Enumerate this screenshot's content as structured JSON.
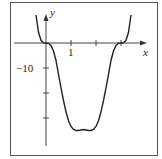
{
  "chart_data": {
    "type": "line",
    "title": "",
    "xlabel": "x",
    "ylabel": "y",
    "x_ticks": [
      1,
      2,
      3
    ],
    "x_tick_labels": [
      {
        "value": 1,
        "label": "1"
      }
    ],
    "y_ticks": [
      -10,
      -20,
      -30
    ],
    "y_tick_labels": [
      {
        "value": -10,
        "label": "−10"
      }
    ],
    "xlim": [
      -0.45,
      3.45
    ],
    "ylim": [
      -41,
      12
    ],
    "grid": false,
    "legend": null,
    "frame": true,
    "series": [
      {
        "name": "f(x)",
        "color": "#222222",
        "x": [
          -0.4,
          -0.3,
          -0.2,
          -0.1,
          0,
          0.1,
          0.2,
          0.3,
          0.4,
          0.5,
          0.6,
          0.7,
          0.8,
          0.9,
          1.0,
          1.1,
          1.2,
          1.3,
          1.4,
          1.5,
          1.6,
          1.7,
          1.8,
          1.9,
          2.0,
          2.1,
          2.2,
          2.3,
          2.4,
          2.5,
          2.6,
          2.7,
          2.8,
          2.9,
          3.0,
          3.1,
          3.2,
          3.3,
          3.4
        ],
        "y": [
          11.2,
          4.3,
          1.1,
          0.1,
          0,
          -0.1,
          -1.0,
          -3.2,
          -7.0,
          -12.5,
          -17.9,
          -23.0,
          -27.5,
          -31.1,
          -33.4,
          -34.6,
          -35.0,
          -35.0,
          -34.8,
          -34.6,
          -34.8,
          -35.0,
          -35.0,
          -34.6,
          -33.4,
          -31.1,
          -27.5,
          -23.0,
          -17.9,
          -12.5,
          -7.0,
          -3.2,
          -1.0,
          -0.1,
          0,
          0.1,
          1.1,
          4.3,
          11.2
        ]
      }
    ]
  },
  "layout": {
    "origin_px": [
      46,
      43
    ],
    "px_per_x": 25,
    "px_per_y": 2.5,
    "frame": [
      10,
      2,
      157,
      155
    ],
    "y_axis_extent": [
      14,
      146
    ],
    "x_axis_extent": [
      14,
      147
    ]
  }
}
